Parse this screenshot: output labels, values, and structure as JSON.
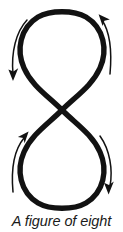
{
  "diagram": {
    "title": "A figure of eight",
    "type": "figure-eight-path-with-direction-arrows",
    "colors": {
      "stroke": "#121212",
      "arrow": "#121212",
      "background": "#ffffff",
      "caption": "#1a1a1a"
    },
    "canvas": {
      "width": 123,
      "height": 232
    },
    "curve": {
      "name": "figure-eight-curve",
      "stroke_width": 5.4,
      "crossing_point": {
        "x": 62,
        "y": 110
      },
      "top_loop": {
        "name": "top-loop",
        "shape": "teardrop",
        "top_y": 12,
        "left_x": 21,
        "right_x": 100
      },
      "bottom_loop": {
        "name": "bottom-loop",
        "shape": "inverted-teardrop",
        "bottom_y": 207,
        "left_x": 21,
        "right_x": 100
      }
    },
    "arrows": [
      {
        "id": "top-left-arrow",
        "label": "top-left direction arrow",
        "direction": "downward",
        "head_position": {
          "x": 13,
          "y": 79
        },
        "head_points": "down-left"
      },
      {
        "id": "top-right-arrow",
        "label": "top-right direction arrow",
        "direction": "upward",
        "head_position": {
          "x": 104,
          "y": 16
        },
        "head_points": "up-left"
      },
      {
        "id": "bottom-left-arrow",
        "label": "bottom-left direction arrow",
        "direction": "upward",
        "head_position": {
          "x": 22,
          "y": 132
        },
        "head_points": "up-right"
      },
      {
        "id": "bottom-right-arrow",
        "label": "bottom-right direction arrow",
        "direction": "downward",
        "head_position": {
          "x": 110,
          "y": 191
        },
        "head_points": "down-right"
      }
    ]
  },
  "caption": {
    "text": "A figure of eight"
  }
}
